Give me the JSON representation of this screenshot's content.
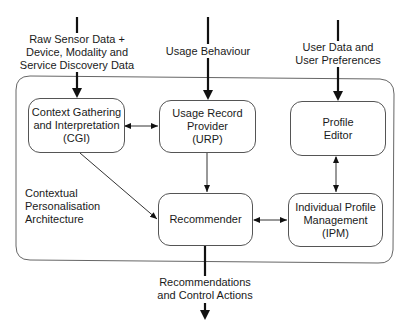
{
  "diagram": {
    "container": {
      "label": "Contextual\nPersonalisation\nArchitecture"
    },
    "inputs": [
      {
        "id": "raw-sensor",
        "label": "Raw Sensor Data +\nDevice, Modality and\nService Discovery Data"
      },
      {
        "id": "usage-behaviour",
        "label": "Usage Behaviour"
      },
      {
        "id": "user-data",
        "label": "User Data and\nUser Preferences"
      }
    ],
    "output": {
      "label": "Recommendations\nand Control Actions"
    },
    "nodes": [
      {
        "id": "cgi",
        "label": "Context Gathering\nand Interpretation\n(CGI)"
      },
      {
        "id": "urp",
        "label": "Usage Record\nProvider\n(URP)"
      },
      {
        "id": "profile-editor",
        "label": "Profile\nEditor"
      },
      {
        "id": "recommender",
        "label": "Recommender"
      },
      {
        "id": "ipm",
        "label": "Individual Profile\nManagement\n(IPM)"
      }
    ],
    "edges": [
      {
        "from": "raw-sensor",
        "to": "cgi",
        "type": "thick"
      },
      {
        "from": "usage-behaviour",
        "to": "urp",
        "type": "thick"
      },
      {
        "from": "user-data",
        "to": "profile-editor",
        "type": "thick"
      },
      {
        "from": "cgi",
        "to": "urp",
        "type": "bidirectional"
      },
      {
        "from": "cgi",
        "to": "recommender",
        "type": "directed"
      },
      {
        "from": "urp",
        "to": "recommender",
        "type": "directed"
      },
      {
        "from": "profile-editor",
        "to": "ipm",
        "type": "bidirectional"
      },
      {
        "from": "recommender",
        "to": "ipm",
        "type": "bidirectional"
      },
      {
        "from": "recommender",
        "to": "output",
        "type": "thick"
      }
    ]
  }
}
